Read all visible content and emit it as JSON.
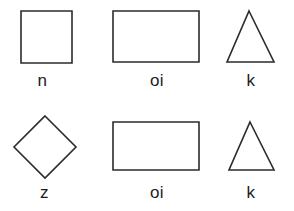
{
  "page": {
    "background_color": "#ffffff",
    "stroke_color": "#2b2b2b",
    "label_color": "#1c1c1c",
    "width": 294,
    "height": 211,
    "rows": 2,
    "columns": 3
  },
  "shapes": [
    {
      "id": "shape-1",
      "kind": "square",
      "label": "n",
      "row": 1,
      "column": 1,
      "points": "21,11 72,11 72,63 21,63",
      "bbox": {
        "x": 21,
        "y": 11,
        "width": 51,
        "height": 52
      }
    },
    {
      "id": "shape-2",
      "kind": "rectangle",
      "label": "oi",
      "row": 1,
      "column": 2,
      "points": "15,11 101,11 101,62 15,62",
      "bbox": {
        "x": 113,
        "y": 11,
        "width": 86,
        "height": 51
      }
    },
    {
      "id": "shape-3",
      "kind": "triangle",
      "label": "k",
      "row": 1,
      "column": 3,
      "points": "33,11 58,62 11,62",
      "bbox": {
        "x": 227,
        "y": 11,
        "width": 47,
        "height": 51
      }
    },
    {
      "id": "shape-4",
      "kind": "diamond",
      "label": "z",
      "row": 2,
      "column": 1,
      "points": "45,11 76,42 45,73 14,42",
      "bbox": {
        "x": 14,
        "y": 116,
        "width": 62,
        "height": 62
      }
    },
    {
      "id": "shape-5",
      "kind": "rectangle",
      "label": "oi",
      "row": 2,
      "column": 2,
      "points": "15,17 101,17 101,65 15,65",
      "bbox": {
        "x": 113,
        "y": 122,
        "width": 86,
        "height": 48
      }
    },
    {
      "id": "shape-6",
      "kind": "triangle",
      "label": "k",
      "row": 2,
      "column": 3,
      "points": "34,17 58,65 13,65",
      "bbox": {
        "x": 229,
        "y": 122,
        "width": 45,
        "height": 48
      }
    }
  ]
}
